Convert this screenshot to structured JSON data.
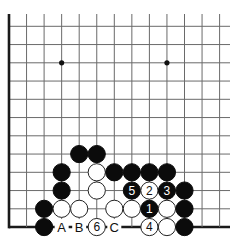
{
  "diagram": {
    "type": "go-board-fragment",
    "columns": 13,
    "rows": 12,
    "visible_edges": [
      "left",
      "bottom"
    ],
    "colors": {
      "black_stone": "#0b0b0b",
      "white_stone": "#ffffff",
      "grid": "#6a6a6a",
      "edge": "#1a1a1a"
    },
    "hoshi": [
      {
        "col": 3,
        "row": 2
      },
      {
        "col": 9,
        "row": 2
      }
    ],
    "stones": [
      {
        "col": 4,
        "row": 7,
        "color": "black",
        "label": ""
      },
      {
        "col": 5,
        "row": 7,
        "color": "black",
        "label": ""
      },
      {
        "col": 3,
        "row": 8,
        "color": "black",
        "label": ""
      },
      {
        "col": 5,
        "row": 8,
        "color": "white",
        "label": ""
      },
      {
        "col": 6,
        "row": 8,
        "color": "black",
        "label": ""
      },
      {
        "col": 7,
        "row": 8,
        "color": "black",
        "label": ""
      },
      {
        "col": 8,
        "row": 8,
        "color": "black",
        "label": ""
      },
      {
        "col": 9,
        "row": 8,
        "color": "black",
        "label": ""
      },
      {
        "col": 3,
        "row": 9,
        "color": "black",
        "label": ""
      },
      {
        "col": 5,
        "row": 9,
        "color": "white",
        "label": ""
      },
      {
        "col": 7,
        "row": 9,
        "color": "black",
        "label": "5"
      },
      {
        "col": 8,
        "row": 9,
        "color": "white",
        "label": "2"
      },
      {
        "col": 9,
        "row": 9,
        "color": "black",
        "label": "3"
      },
      {
        "col": 10,
        "row": 9,
        "color": "black",
        "label": ""
      },
      {
        "col": 2,
        "row": 10,
        "color": "black",
        "label": ""
      },
      {
        "col": 3,
        "row": 10,
        "color": "white",
        "label": ""
      },
      {
        "col": 4,
        "row": 10,
        "color": "white",
        "label": ""
      },
      {
        "col": 6,
        "row": 10,
        "color": "white",
        "label": ""
      },
      {
        "col": 7,
        "row": 10,
        "color": "white",
        "label": ""
      },
      {
        "col": 8,
        "row": 10,
        "color": "black",
        "label": "1"
      },
      {
        "col": 9,
        "row": 10,
        "color": "white",
        "label": ""
      },
      {
        "col": 10,
        "row": 10,
        "color": "black",
        "label": ""
      },
      {
        "col": 2,
        "row": 11,
        "color": "black",
        "label": ""
      },
      {
        "col": 5,
        "row": 11,
        "color": "white",
        "label": "6"
      },
      {
        "col": 8,
        "row": 11,
        "color": "white",
        "label": "4"
      },
      {
        "col": 9,
        "row": 11,
        "color": "white",
        "label": ""
      },
      {
        "col": 10,
        "row": 11,
        "color": "black",
        "label": ""
      }
    ],
    "point_labels": [
      {
        "col": 3,
        "row": 11,
        "text": "A"
      },
      {
        "col": 4,
        "row": 11,
        "text": "B"
      },
      {
        "col": 6,
        "row": 11,
        "text": "C"
      }
    ]
  }
}
